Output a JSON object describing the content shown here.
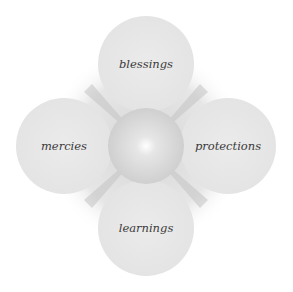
{
  "diagram": {
    "center": {
      "x": 146,
      "y": 146,
      "r": 38
    },
    "petals": [
      {
        "id": "top",
        "label": "blessings",
        "cx": 146,
        "cy": 64,
        "r": 48
      },
      {
        "id": "left",
        "label": "mercies",
        "cx": 64,
        "cy": 146,
        "r": 48
      },
      {
        "id": "right",
        "label": "protections",
        "cx": 228,
        "cy": 146,
        "r": 48
      },
      {
        "id": "bottom",
        "label": "learnings",
        "cx": 146,
        "cy": 228,
        "r": 48
      }
    ],
    "colors": {
      "petal": "#e8e8e8",
      "shadow": "#c9c9c9",
      "center": "#d4d4d4",
      "glow": "#ffffff",
      "text": "#3a3a3a"
    }
  }
}
